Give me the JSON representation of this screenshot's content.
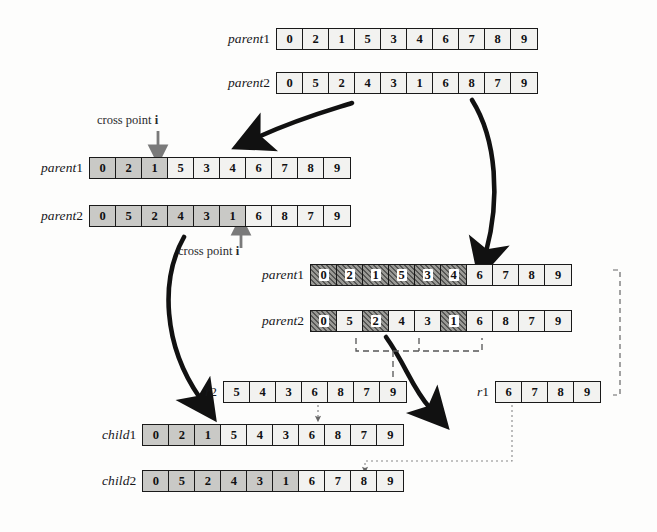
{
  "diagram": {
    "labels": {
      "cross_point": "cross point",
      "cross_point_var": "i"
    },
    "colors": {
      "cell_fill": "#f2f2f0",
      "cell_shaded": "#c9c9c6",
      "cell_hatched": "#9a9a96",
      "stroke": "#1a1a1a",
      "dashed": "#555555"
    },
    "rows": [
      {
        "id": "top-parent1",
        "label": "parent",
        "index": "1",
        "values": [
          0,
          2,
          1,
          5,
          3,
          4,
          6,
          7,
          8,
          9
        ],
        "styles": [
          "plain",
          "plain",
          "plain",
          "plain",
          "plain",
          "plain",
          "plain",
          "plain",
          "plain",
          "plain"
        ]
      },
      {
        "id": "top-parent2",
        "label": "parent",
        "index": "2",
        "values": [
          0,
          5,
          2,
          4,
          3,
          1,
          6,
          8,
          7,
          9
        ],
        "styles": [
          "plain",
          "plain",
          "plain",
          "plain",
          "plain",
          "plain",
          "plain",
          "plain",
          "plain",
          "plain"
        ]
      },
      {
        "id": "left-parent1",
        "label": "parent",
        "index": "1",
        "values": [
          0,
          2,
          1,
          5,
          3,
          4,
          6,
          7,
          8,
          9
        ],
        "styles": [
          "shaded",
          "shaded",
          "shaded",
          "plain",
          "plain",
          "plain",
          "plain",
          "plain",
          "plain",
          "plain"
        ]
      },
      {
        "id": "left-parent2",
        "label": "parent",
        "index": "2",
        "values": [
          0,
          5,
          2,
          4,
          3,
          1,
          6,
          8,
          7,
          9
        ],
        "styles": [
          "shaded",
          "shaded",
          "shaded",
          "shaded",
          "shaded",
          "shaded",
          "plain",
          "plain",
          "plain",
          "plain"
        ]
      },
      {
        "id": "mid-parent1",
        "label": "parent",
        "index": "1",
        "values": [
          0,
          2,
          1,
          5,
          3,
          4,
          6,
          7,
          8,
          9
        ],
        "styles": [
          "hatched",
          "hatched",
          "hatched",
          "hatched",
          "hatched",
          "hatched",
          "plain",
          "plain",
          "plain",
          "plain"
        ]
      },
      {
        "id": "mid-parent2",
        "label": "parent",
        "index": "2",
        "values": [
          0,
          5,
          2,
          4,
          3,
          1,
          6,
          8,
          7,
          9
        ],
        "styles": [
          "hatched",
          "plain",
          "hatched",
          "plain",
          "plain",
          "hatched",
          "plain",
          "plain",
          "plain",
          "plain"
        ]
      },
      {
        "id": "r2",
        "label": "r",
        "index": "2",
        "values": [
          5,
          4,
          3,
          6,
          8,
          7,
          9
        ],
        "styles": [
          "plain",
          "plain",
          "plain",
          "plain",
          "plain",
          "plain",
          "plain"
        ]
      },
      {
        "id": "r1",
        "label": "r",
        "index": "1",
        "values": [
          6,
          7,
          8,
          9
        ],
        "styles": [
          "plain",
          "plain",
          "plain",
          "plain"
        ]
      },
      {
        "id": "child1",
        "label": "child",
        "index": "1",
        "values": [
          0,
          2,
          1,
          5,
          4,
          3,
          6,
          8,
          7,
          9
        ],
        "styles": [
          "shaded",
          "shaded",
          "shaded",
          "plain",
          "plain",
          "plain",
          "plain",
          "plain",
          "plain",
          "plain"
        ]
      },
      {
        "id": "child2",
        "label": "child",
        "index": "2",
        "values": [
          0,
          5,
          2,
          4,
          3,
          1,
          6,
          7,
          8,
          9
        ],
        "styles": [
          "shaded",
          "shaded",
          "shaded",
          "shaded",
          "shaded",
          "shaded",
          "plain",
          "plain",
          "plain",
          "plain"
        ]
      }
    ]
  }
}
